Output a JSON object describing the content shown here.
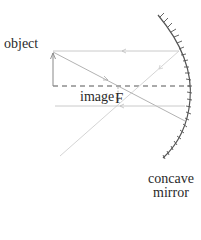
{
  "labels": {
    "object": "object",
    "image": "image",
    "focal_point": "F",
    "mirror_line1": "concave",
    "mirror_line2": "mirror"
  },
  "colors": {
    "text": "#2a2a2a",
    "mirror": "#555555",
    "axis": "#555555",
    "ray": "#bcbcbc",
    "arrow": "#888888"
  },
  "diagram": {
    "type": "ray diagram",
    "elements": [
      "object arrow",
      "principal axis (dashed)",
      "focal point F",
      "inverted image arrow",
      "incident and reflected rays",
      "concave mirror"
    ]
  }
}
